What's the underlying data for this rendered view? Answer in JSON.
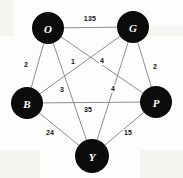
{
  "figure": {
    "width": 183,
    "height": 178,
    "background_color": "#fdfdfc",
    "node_fill_color": "#0b0b0b",
    "node_text_color": "#ffffff",
    "edge_color": "#8e8e8e",
    "label_color": "#111111"
  },
  "chart_data": {
    "type": "diagram",
    "subtype": "weighted-undirected-graph",
    "directed": false,
    "complete": true,
    "node_count": 5,
    "edge_count": 10,
    "nodes": [
      {
        "id": "O",
        "label": "O",
        "x": 48,
        "y": 28,
        "r": 16
      },
      {
        "id": "G",
        "label": "G",
        "x": 133,
        "y": 27,
        "r": 16
      },
      {
        "id": "B",
        "label": "B",
        "x": 27,
        "y": 103,
        "r": 16
      },
      {
        "id": "P",
        "label": "P",
        "x": 156,
        "y": 102,
        "r": 16
      },
      {
        "id": "Y",
        "label": "Y",
        "x": 92,
        "y": 156,
        "r": 17
      }
    ],
    "edges": [
      {
        "source": "O",
        "target": "G",
        "weight": "135",
        "label_x": 90,
        "label_y": 19
      },
      {
        "source": "O",
        "target": "B",
        "weight": "2",
        "label_x": 26,
        "label_y": 65
      },
      {
        "source": "O",
        "target": "P",
        "weight": "1",
        "label_x": 73,
        "label_y": 62
      },
      {
        "source": "G",
        "target": "B",
        "weight": "4",
        "label_x": 102,
        "label_y": 61
      },
      {
        "source": "G",
        "target": "P",
        "weight": "2",
        "label_x": 155,
        "label_y": 67
      },
      {
        "source": "O",
        "target": "Y",
        "weight": "3",
        "label_x": 62,
        "label_y": 90
      },
      {
        "source": "G",
        "target": "Y",
        "weight": "4",
        "label_x": 113,
        "label_y": 89
      },
      {
        "source": "B",
        "target": "P",
        "weight": "35",
        "label_x": 88,
        "label_y": 110
      },
      {
        "source": "B",
        "target": "Y",
        "weight": "24",
        "label_x": 50,
        "label_y": 133
      },
      {
        "source": "P",
        "target": "Y",
        "weight": "15",
        "label_x": 128,
        "label_y": 133
      }
    ]
  }
}
